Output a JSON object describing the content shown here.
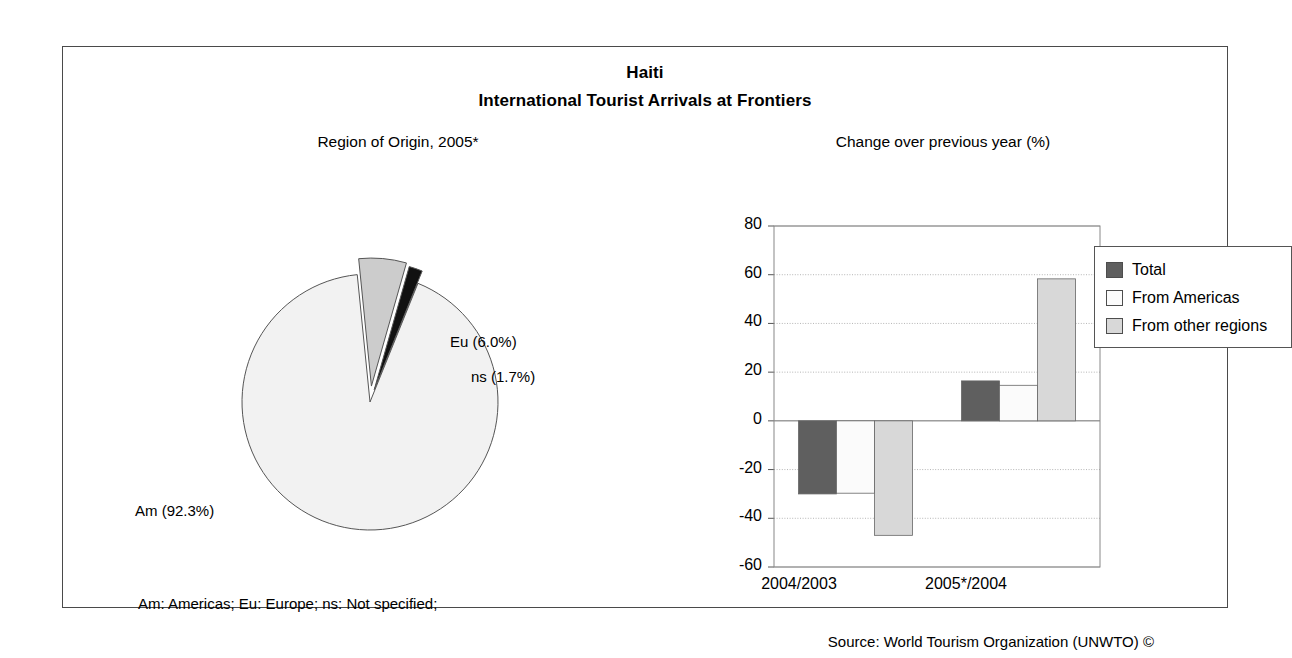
{
  "chart_header": {
    "country": "Haiti",
    "subtitle": "International Tourist Arrivals at Frontiers"
  },
  "pie_panel_title": "Region of Origin, 2005*",
  "bar_panel_title": "Change over previous year (%)",
  "footnote": "Am: Americas; Eu: Europe; ns: Not specified;",
  "source": "Source: World Tourism Organization (UNWTO) ©",
  "colors": {
    "pie_americas": "#f2f2f2",
    "pie_europe": "#cccccc",
    "pie_ns": "#111111",
    "bar_total": "#5f5f5f",
    "bar_americas": "#fbfbfb",
    "bar_other": "#d8d8d8",
    "outline": "#4a4a4a",
    "grid": "#b5b5b5"
  },
  "legend": {
    "items": [
      {
        "label": "Total",
        "swatch": "bar_total"
      },
      {
        "label": "From Americas",
        "swatch": "bar_americas"
      },
      {
        "label": "From other regions",
        "swatch": "bar_other"
      }
    ]
  },
  "chart_data": [
    {
      "type": "pie",
      "title": "Region of Origin, 2005*",
      "labels": [
        "Am (92.3%)",
        "Eu (6.0%)",
        "ns (1.7%)"
      ],
      "categories": [
        "Am",
        "Eu",
        "ns"
      ],
      "values": [
        92.3,
        6.0,
        1.7
      ],
      "exploded": [
        false,
        true,
        true
      ],
      "legend": "none"
    },
    {
      "type": "bar",
      "title": "Change over previous year (%)",
      "categories": [
        "2004/2003",
        "2005*/2004"
      ],
      "series": [
        {
          "name": "Total",
          "values": [
            -30.0,
            16.4
          ]
        },
        {
          "name": "From Americas",
          "values": [
            -29.7,
            14.6
          ]
        },
        {
          "name": "From other regions",
          "values": [
            -47.0,
            58.3
          ]
        }
      ],
      "ylabel": "",
      "xlabel": "",
      "ylim": [
        -60,
        80
      ],
      "yticks": [
        80,
        60,
        40,
        20,
        0,
        -20,
        -40,
        -60
      ],
      "ytick_labels": [
        "80",
        "60",
        "40",
        "20",
        "0",
        "-20",
        "-40",
        "-60"
      ],
      "grid": true,
      "legend_position": "top-right-outside"
    }
  ]
}
